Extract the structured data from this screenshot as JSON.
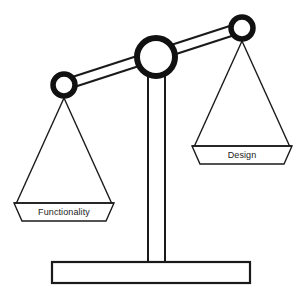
{
  "figure": {
    "type": "balance-scale-diagram",
    "background_color": "#ffffff",
    "stroke_color": "#1a1a1a",
    "fill_color": "#ffffff"
  },
  "scale": {
    "left_pan": {
      "label": "Functionality",
      "state": "lower",
      "hanger_center": {
        "x": 64,
        "y": 85
      },
      "pan_top_y": 203
    },
    "right_pan": {
      "label": "Design",
      "state": "higher",
      "hanger_center": {
        "x": 242,
        "y": 28
      },
      "pan_top_y": 146
    },
    "fulcrum": {
      "label": "pivot",
      "center": {
        "x": 156,
        "y": 57
      },
      "radius": 22
    },
    "beam": {
      "left_end": {
        "x": 64,
        "y": 85
      },
      "right_end": {
        "x": 242,
        "y": 28
      },
      "tilt": "left-down"
    },
    "column": {
      "left_x": 148,
      "right_x": 165,
      "top_y": 70,
      "bottom_y": 263
    },
    "base": {
      "x": 52,
      "y": 262,
      "width": 198,
      "height": 21
    }
  }
}
